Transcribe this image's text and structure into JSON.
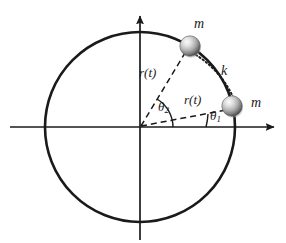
{
  "figure": {
    "type": "physics-diagram",
    "colors": {
      "stroke": "#1a1a1a",
      "ball_light": "#f2f2f2",
      "ball_mid": "#b4b4b4",
      "ball_dark": "#4d4d4d",
      "background": "#ffffff"
    },
    "geometry": {
      "circle": {
        "cx": 140,
        "cy": 127,
        "r": 95
      },
      "origin": {
        "x": 140,
        "y": 127
      },
      "ball_top": {
        "cx": 190,
        "cy": 46,
        "r": 10.5
      },
      "ball_right": {
        "cx": 232,
        "cy": 106,
        "r": 10.5
      },
      "x_axis": {
        "x1": 10,
        "y1": 127,
        "x2": 278,
        "y2": 127
      },
      "y_axis": {
        "x1": 140,
        "y1": 240,
        "x2": 140,
        "y2": 12
      }
    },
    "labels": {
      "mass_top": "m",
      "mass_right": "m",
      "spring": "k",
      "radius_top": "r(t)",
      "radius_right": "r(t)",
      "theta2_base": "θ",
      "theta2_sub": "2",
      "theta1_base": "θ",
      "theta1_sub": "1"
    }
  }
}
